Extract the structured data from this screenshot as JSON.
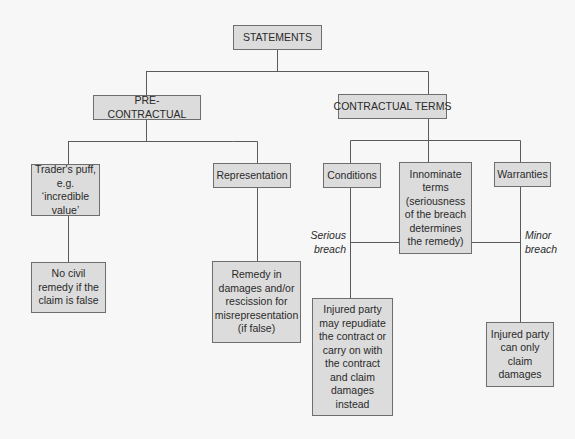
{
  "diagram": {
    "type": "hierarchy-tree",
    "root": {
      "id": "statements",
      "label": "STATEMENTS"
    },
    "level1": {
      "pre_contractual": {
        "label": "PRE-CONTRACTUAL"
      },
      "contractual_terms": {
        "label": "CONTRACTUAL TERMS"
      }
    },
    "pre_contractual_children": {
      "traders_puff": {
        "lines": [
          "Trader's puff,",
          "e.g. ‘incredible",
          "value’"
        ]
      },
      "representation": {
        "label": "Representation"
      }
    },
    "pre_contractual_outcomes": {
      "no_civil_remedy": {
        "lines": [
          "No civil",
          "remedy if the",
          "claim is false"
        ]
      },
      "remedy_in_damages": {
        "lines": [
          "Remedy in",
          "damages and/or",
          "rescission for",
          "misrepresentation",
          "(if false)"
        ]
      }
    },
    "contractual_children": {
      "conditions": {
        "label": "Conditions"
      },
      "innominate_terms": {
        "lines": [
          "Innominate",
          "terms",
          "(seriousness",
          "of the breach",
          "determines",
          "the remedy)"
        ]
      },
      "warranties": {
        "label": "Warranties"
      }
    },
    "edge_labels": {
      "serious_breach": [
        "Serious",
        "breach"
      ],
      "minor_breach": [
        "Minor",
        "breach"
      ]
    },
    "contractual_outcomes": {
      "repudiate": {
        "lines": [
          "Injured party",
          "may repudiate",
          "the contract or",
          "carry on with",
          "the contract",
          "and claim",
          "damages",
          "instead"
        ]
      },
      "damages_only": {
        "lines": [
          "Injured party",
          "can only",
          "claim",
          "damages"
        ]
      }
    },
    "edges": [
      [
        "STATEMENTS",
        "PRE-CONTRACTUAL"
      ],
      [
        "STATEMENTS",
        "CONTRACTUAL TERMS"
      ],
      [
        "PRE-CONTRACTUAL",
        "Trader's puff"
      ],
      [
        "PRE-CONTRACTUAL",
        "Representation"
      ],
      [
        "Trader's puff",
        "No civil remedy if the claim is false"
      ],
      [
        "Representation",
        "Remedy in damages and/or rescission for misrepresentation (if false)"
      ],
      [
        "CONTRACTUAL TERMS",
        "Conditions"
      ],
      [
        "CONTRACTUAL TERMS",
        "Innominate terms"
      ],
      [
        "CONTRACTUAL TERMS",
        "Warranties"
      ],
      [
        "Innominate terms",
        "Conditions branch (Serious breach)"
      ],
      [
        "Innominate terms",
        "Warranties branch (Minor breach)"
      ],
      [
        "Conditions",
        "Injured party may repudiate the contract or carry on with the contract and claim damages instead"
      ],
      [
        "Warranties",
        "Injured party can only claim damages"
      ]
    ],
    "colors": {
      "background": "#f7f7f7",
      "box_fill": "#dcdcdc",
      "box_border": "#6e6e6e",
      "line": "#5a5a5a",
      "text": "#2a2a2a"
    }
  }
}
